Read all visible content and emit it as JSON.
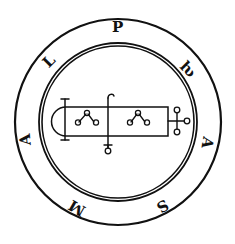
{
  "image": {
    "subject": "circular seal / sigil",
    "colors": {
      "ink": "#111111",
      "background": "#ffffff"
    }
  },
  "ring_letters": [
    {
      "char": "P",
      "x": 118,
      "y": 27,
      "rotate": 0
    },
    {
      "char": "ƕ",
      "x": 186,
      "y": 69,
      "rotate": 45
    },
    {
      "char": "A",
      "x": 207,
      "y": 142,
      "rotate": 100
    },
    {
      "char": "S",
      "x": 162,
      "y": 205,
      "rotate": 150
    },
    {
      "char": "M",
      "x": 76,
      "y": 207,
      "rotate": 210
    },
    {
      "char": "A",
      "x": 26,
      "y": 139,
      "rotate": 265
    },
    {
      "char": "L",
      "x": 50,
      "y": 61,
      "rotate": 315
    }
  ]
}
